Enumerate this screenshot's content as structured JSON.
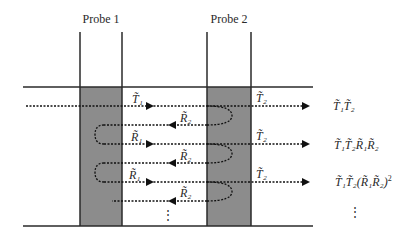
{
  "probes": [
    {
      "label": "Probe 1"
    },
    {
      "label": "Probe 2"
    }
  ],
  "path_labels": {
    "t1": "T̃₁",
    "t2_row1": "T̃₂",
    "r2_row2": "R̃₂",
    "r1_row3": "R̃₁",
    "t2_row3": "T̃₂",
    "r2_row4": "R̃₂",
    "r1_row5": "R̃₁",
    "t2_row5": "T̃₂",
    "r2_row6": "R̃₂"
  },
  "outputs": [
    {
      "base": "T̃₁T̃₂"
    },
    {
      "base": "T̃₁T̃₂R̃₁R̃₂"
    },
    {
      "base": "T̃₁T̃₂(R̃₁R̃₂)",
      "sup": "2"
    }
  ],
  "ellipsis": "⋮",
  "colors": {
    "probe_fill": "#8c8c8c",
    "line": "#2a2a2a"
  }
}
